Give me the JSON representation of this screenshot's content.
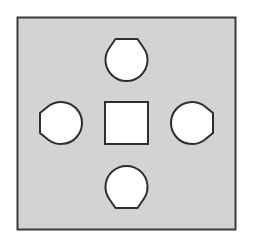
{
  "canvas": {
    "width": 253,
    "height": 238,
    "background": "#ffffff"
  },
  "colors": {
    "plate_fill": "#d3d3d3",
    "plate_stroke": "#3a3a3a",
    "hole_fill": "#ffffff",
    "hole_stroke": "#2e2e2e"
  },
  "plate": {
    "x": 17.5,
    "y": 17.5,
    "width": 218,
    "height": 212,
    "stroke_width": 2
  },
  "center_square": {
    "x": 105,
    "y": 102,
    "width": 43,
    "height": 42,
    "stroke_width": 2
  },
  "holes": [
    {
      "id": "top",
      "cx": 126.5,
      "cy": 60,
      "radius": 21,
      "flat_at": "top",
      "flat_half_width": 11,
      "flat_offset": 21
    },
    {
      "id": "bottom",
      "cx": 126.5,
      "cy": 187,
      "radius": 21,
      "flat_at": "bottom",
      "flat_half_width": 11,
      "flat_offset": 21
    },
    {
      "id": "left",
      "cx": 61,
      "cy": 123,
      "radius": 21,
      "flat_at": "left",
      "flat_half_width": 10,
      "flat_offset": 21
    },
    {
      "id": "right",
      "cx": 192,
      "cy": 123,
      "radius": 21,
      "flat_at": "right",
      "flat_half_width": 10,
      "flat_offset": 21
    }
  ]
}
